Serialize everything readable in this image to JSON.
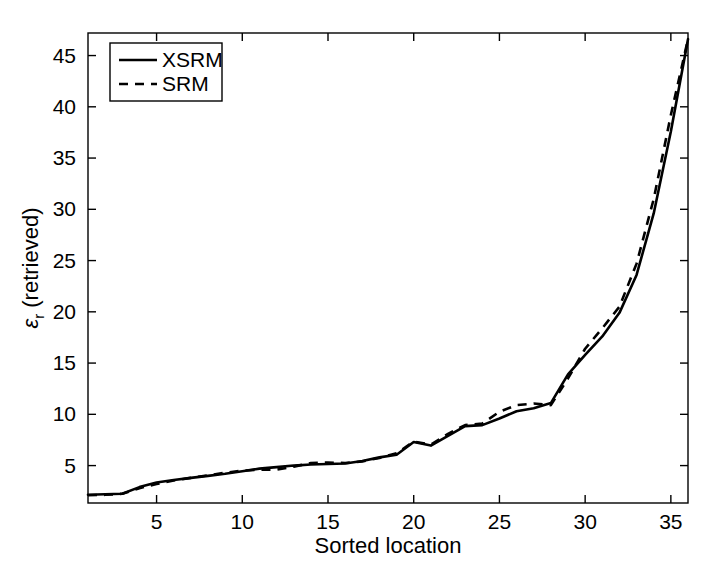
{
  "chart_data": {
    "type": "line",
    "title": "",
    "xlabel": "Sorted location",
    "ylabel": "ε_r (retrieved)",
    "ylabel_base": "ε",
    "ylabel_sub": "r",
    "ylabel_rest": " (retrieved)",
    "xlim": [
      1,
      36
    ],
    "ylim": [
      1.35,
      47.2
    ],
    "xticks": [
      5,
      10,
      15,
      20,
      25,
      30,
      35
    ],
    "yticks": [
      5,
      10,
      15,
      20,
      25,
      30,
      35,
      40,
      45
    ],
    "grid": false,
    "legend_position": "top-left",
    "x": [
      1,
      2,
      3,
      4,
      5,
      6,
      7,
      8,
      9,
      10,
      11,
      12,
      13,
      14,
      15,
      16,
      17,
      18,
      19,
      20,
      21,
      22,
      23,
      24,
      25,
      26,
      27,
      28,
      29,
      30,
      31,
      32,
      33,
      34,
      35,
      36
    ],
    "series": [
      {
        "name": "XSRM",
        "style": "solid",
        "values": [
          2.15,
          2.2,
          2.25,
          2.9,
          3.35,
          3.6,
          3.8,
          4.0,
          4.2,
          4.45,
          4.7,
          4.85,
          5.0,
          5.1,
          5.15,
          5.2,
          5.45,
          5.8,
          6.05,
          7.3,
          6.95,
          7.9,
          8.85,
          8.95,
          9.6,
          10.3,
          10.6,
          11.1,
          13.9,
          15.8,
          17.6,
          19.9,
          23.6,
          29.6,
          37.6,
          46.6
        ]
      },
      {
        "name": "SRM",
        "style": "dashed",
        "values": [
          2.1,
          2.15,
          2.25,
          2.8,
          3.2,
          3.55,
          3.8,
          4.05,
          4.3,
          4.5,
          4.6,
          4.6,
          4.9,
          5.25,
          5.3,
          5.25,
          5.4,
          5.75,
          6.2,
          7.35,
          7.05,
          8.1,
          8.95,
          9.1,
          10.25,
          10.9,
          11.05,
          10.9,
          13.5,
          16.4,
          18.4,
          20.5,
          24.7,
          31.0,
          39.2,
          46.6
        ]
      }
    ],
    "legend": [
      {
        "label": "XSRM",
        "style": "solid"
      },
      {
        "label": "SRM",
        "style": "dashed"
      }
    ]
  },
  "axis": {
    "x_tick_labels": [
      "5",
      "10",
      "15",
      "20",
      "25",
      "30",
      "35"
    ],
    "y_tick_labels": [
      "5",
      "10",
      "15",
      "20",
      "25",
      "30",
      "35",
      "40",
      "45"
    ],
    "x_title": "Sorted location"
  }
}
